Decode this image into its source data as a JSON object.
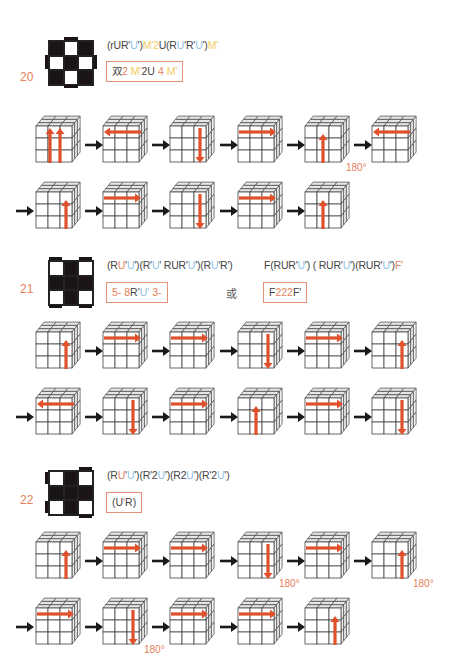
{
  "cases": [
    {
      "number": "20",
      "pattern": [
        "b",
        "w",
        "b",
        "w",
        "b",
        "w",
        "b",
        "w",
        "b"
      ],
      "pattern_bars": [
        "top",
        "bottom",
        "left",
        "right"
      ],
      "formula": [
        {
          "t": "(rUR'",
          "c": ""
        },
        {
          "t": "U",
          "c": "blue"
        },
        {
          "t": "'",
          "c": ""
        },
        {
          "t": ")",
          "c": ""
        },
        {
          "t": "M'2",
          "c": "yel"
        },
        {
          "t": "U(R",
          "c": ""
        },
        {
          "t": "U",
          "c": "blue"
        },
        {
          "t": "'R'",
          "c": ""
        },
        {
          "t": "U",
          "c": "blue"
        },
        {
          "t": "')",
          "c": ""
        },
        {
          "t": "M'",
          "c": "yel"
        }
      ],
      "boxed": [
        {
          "t": "双",
          "c": ""
        },
        {
          "t": "2",
          "c": "red"
        },
        {
          "t": "  ",
          "c": ""
        },
        {
          "t": "M'",
          "c": "yel"
        },
        {
          "t": "2U",
          "c": ""
        },
        {
          "t": "  4 ",
          "c": "red"
        },
        {
          "t": "M'",
          "c": "yel"
        }
      ],
      "rows": [
        {
          "lead_arrow": false,
          "steps": [
            {
              "arrow": "up-double",
              "degree": ""
            },
            {
              "arrow": "left-top",
              "degree": ""
            },
            {
              "arrow": "down-right",
              "degree": ""
            },
            {
              "arrow": "right-top",
              "degree": ""
            },
            {
              "arrow": "up-middle",
              "degree": "180°"
            },
            {
              "arrow": "left-top",
              "degree": ""
            }
          ]
        },
        {
          "lead_arrow": true,
          "steps": [
            {
              "arrow": "up-right",
              "degree": ""
            },
            {
              "arrow": "right-top",
              "degree": ""
            },
            {
              "arrow": "down-right",
              "degree": ""
            },
            {
              "arrow": "right-top",
              "degree": ""
            },
            {
              "arrow": "up-middle",
              "degree": ""
            }
          ]
        }
      ]
    },
    {
      "number": "21",
      "pattern": [
        "w",
        "b",
        "w",
        "b",
        "b",
        "b",
        "w",
        "b",
        "w"
      ],
      "pattern_bars": [
        "top-left",
        "top-right",
        "bottom-left",
        "bottom-right"
      ],
      "formula": [
        {
          "t": "(R",
          "c": ""
        },
        {
          "t": "U",
          "c": "red"
        },
        {
          "t": "'",
          "c": ""
        },
        {
          "t": "U",
          "c": "blue"
        },
        {
          "t": "')(R'",
          "c": ""
        },
        {
          "t": "U",
          "c": "blue"
        },
        {
          "t": "' RUR'",
          "c": ""
        },
        {
          "t": "U",
          "c": "blue"
        },
        {
          "t": "')(R",
          "c": ""
        },
        {
          "t": "U",
          "c": "blue"
        },
        {
          "t": "'R')",
          "c": ""
        }
      ],
      "boxed": [
        {
          "t": "5-",
          "c": "red"
        },
        {
          "t": "  ",
          "c": ""
        },
        {
          "t": "8",
          "c": "red"
        },
        {
          "t": "R'",
          "c": ""
        },
        {
          "t": "U",
          "c": "blue"
        },
        {
          "t": "'",
          "c": "blue"
        },
        {
          "t": "  3-",
          "c": "red"
        }
      ],
      "or_label": "或",
      "alt_formula": [
        {
          "t": "F(RUR'",
          "c": ""
        },
        {
          "t": "U",
          "c": "blue"
        },
        {
          "t": "') ( RUR'",
          "c": ""
        },
        {
          "t": "U",
          "c": "blue"
        },
        {
          "t": "')(RUR'",
          "c": ""
        },
        {
          "t": "U",
          "c": "blue"
        },
        {
          "t": "')",
          "c": ""
        },
        {
          "t": "F'",
          "c": "red"
        }
      ],
      "alt_boxed": [
        {
          "t": "F",
          "c": ""
        },
        {
          "t": "222",
          "c": "red"
        },
        {
          "t": "F'",
          "c": ""
        }
      ],
      "rows": [
        {
          "lead_arrow": false,
          "steps": [
            {
              "arrow": "up-right",
              "degree": ""
            },
            {
              "arrow": "right-top",
              "degree": ""
            },
            {
              "arrow": "right-top",
              "degree": ""
            },
            {
              "arrow": "down-right",
              "degree": ""
            },
            {
              "arrow": "right-top",
              "degree": ""
            },
            {
              "arrow": "up-right",
              "degree": ""
            }
          ]
        },
        {
          "lead_arrow": true,
          "steps": [
            {
              "arrow": "left-top",
              "degree": ""
            },
            {
              "arrow": "down-right",
              "degree": ""
            },
            {
              "arrow": "right-top",
              "degree": ""
            },
            {
              "arrow": "up-middle",
              "degree": ""
            },
            {
              "arrow": "right-top",
              "degree": ""
            },
            {
              "arrow": "down-right",
              "degree": ""
            }
          ]
        }
      ]
    },
    {
      "number": "22",
      "pattern": [
        "w",
        "b",
        "w",
        "b",
        "b",
        "b",
        "w",
        "b",
        "w"
      ],
      "pattern_bars": [
        "top-right",
        "left-top",
        "left-bottom",
        "bottom-right"
      ],
      "formula": [
        {
          "t": "(R",
          "c": ""
        },
        {
          "t": "U",
          "c": "red"
        },
        {
          "t": "'",
          "c": ""
        },
        {
          "t": "U",
          "c": "blue"
        },
        {
          "t": "')(R'2",
          "c": ""
        },
        {
          "t": "U",
          "c": "blue"
        },
        {
          "t": "')(R2",
          "c": ""
        },
        {
          "t": "U",
          "c": "blue"
        },
        {
          "t": "')(R'2",
          "c": ""
        },
        {
          "t": "U",
          "c": "blue"
        },
        {
          "t": "')",
          "c": ""
        }
      ],
      "boxed": [
        {
          "t": "(U",
          "c": ""
        },
        {
          "t": "'",
          "c": "red"
        },
        {
          "t": "R)",
          "c": ""
        }
      ],
      "rows": [
        {
          "lead_arrow": false,
          "steps": [
            {
              "arrow": "up-right",
              "degree": ""
            },
            {
              "arrow": "right-top",
              "degree": ""
            },
            {
              "arrow": "right-top",
              "degree": ""
            },
            {
              "arrow": "down-right",
              "degree": "180°"
            },
            {
              "arrow": "right-top",
              "degree": ""
            },
            {
              "arrow": "up-right",
              "degree": "180°"
            }
          ]
        },
        {
          "lead_arrow": true,
          "steps": [
            {
              "arrow": "right-top",
              "degree": ""
            },
            {
              "arrow": "down-right",
              "degree": "180°"
            },
            {
              "arrow": "right-top",
              "degree": ""
            },
            {
              "arrow": "right-top",
              "degree": ""
            },
            {
              "arrow": "up-right",
              "degree": ""
            }
          ]
        }
      ]
    }
  ],
  "colors": {
    "accent_orange": "#e8805a",
    "arrow_red": "#e0502a",
    "blue": "#8fc3e6",
    "yellow": "#f2cc60",
    "box_border": "#e7917a"
  }
}
